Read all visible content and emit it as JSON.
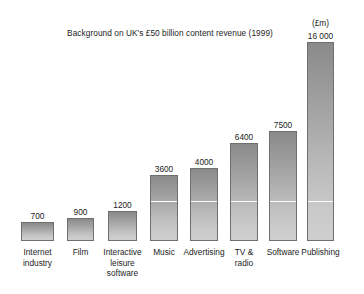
{
  "chart_data": {
    "type": "bar",
    "title": "Background on UK's £50 billion content revenue (1999)",
    "unit_caption": "(£m)",
    "xlabel": "",
    "ylabel": "",
    "grid": false,
    "legend": "none",
    "ylim": [
      0,
      16000
    ],
    "categories": [
      "Internet industry",
      "Film",
      "Interactive leisure software",
      "Music",
      "Advertising",
      "TV & radio",
      "Software",
      "Publishing"
    ],
    "values": [
      700,
      900,
      1200,
      3600,
      4000,
      6400,
      7500,
      16000
    ],
    "value_labels": [
      "700",
      "900",
      "1200",
      "3600",
      "4000",
      "6400",
      "7500",
      "16 000"
    ],
    "colors": {
      "bar_top": "#8a8a8a",
      "bar_bottom": "#cfcfcf",
      "bar_border": "#6f6f6f",
      "fold_line": "#fdfdfd",
      "background": "#ffffff",
      "text": "#1c1c1c"
    }
  },
  "bars": [
    {
      "label_line1": "Internet",
      "label_line2": "industry",
      "label_line3": "",
      "value_label": "700",
      "value": 700,
      "x": 21,
      "width": 33,
      "top": 222,
      "height": 19
    },
    {
      "label_line1": "Film",
      "label_line2": "",
      "label_line3": "",
      "value_label": "900",
      "value": 900,
      "x": 67,
      "width": 27,
      "top": 218,
      "height": 23
    },
    {
      "label_line1": "Interactive",
      "label_line2": "leisure",
      "label_line3": "software",
      "value_label": "1200",
      "value": 1200,
      "x": 108,
      "width": 29,
      "top": 211,
      "height": 30
    },
    {
      "label_line1": "Music",
      "label_line2": "",
      "label_line3": "",
      "value_label": "3600",
      "value": 3600,
      "x": 150,
      "width": 28,
      "top": 175,
      "height": 66
    },
    {
      "label_line1": "Advertising",
      "label_line2": "",
      "label_line3": "",
      "value_label": "4000",
      "value": 4000,
      "x": 190,
      "width": 28,
      "top": 168,
      "height": 73
    },
    {
      "label_line1": "TV &",
      "label_line2": "radio",
      "label_line3": "",
      "value_label": "6400",
      "value": 6400,
      "x": 230,
      "width": 28,
      "top": 143,
      "height": 98
    },
    {
      "label_line1": "Software",
      "label_line2": "",
      "label_line3": "",
      "value_label": "7500",
      "value": 7500,
      "x": 269,
      "width": 28,
      "top": 131,
      "height": 110
    },
    {
      "label_line1": "Publishing",
      "label_line2": "",
      "label_line3": "",
      "value_label": "16 000",
      "value": 16000,
      "x": 307,
      "width": 27,
      "top": 42,
      "height": 199
    }
  ],
  "layout": {
    "baseline_y": 241,
    "fold_y": 200,
    "value_label_offset": 11,
    "category_label_top": 247,
    "unit_caption_x": 307,
    "unit_caption_y": 18,
    "unit_caption_width": 27
  }
}
